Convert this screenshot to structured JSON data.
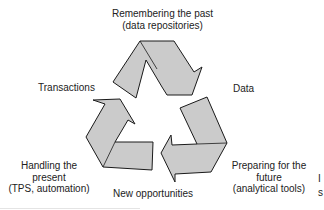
{
  "diagram": {
    "type": "cycle",
    "arrow_fill": "#cbcbcb",
    "arrow_stroke": "#1a1a1a",
    "labels": {
      "top": [
        "Remembering the past",
        "(data repositories)"
      ],
      "right": "Data",
      "bottom_right": [
        "Preparing for the",
        "future",
        "(analytical tools)"
      ],
      "bottom": "New opportunities",
      "bottom_left": [
        "Handling the",
        "present",
        "(TPS, automation)"
      ],
      "left": "Transactions"
    },
    "edge_fragment": [
      "I",
      "s"
    ]
  }
}
